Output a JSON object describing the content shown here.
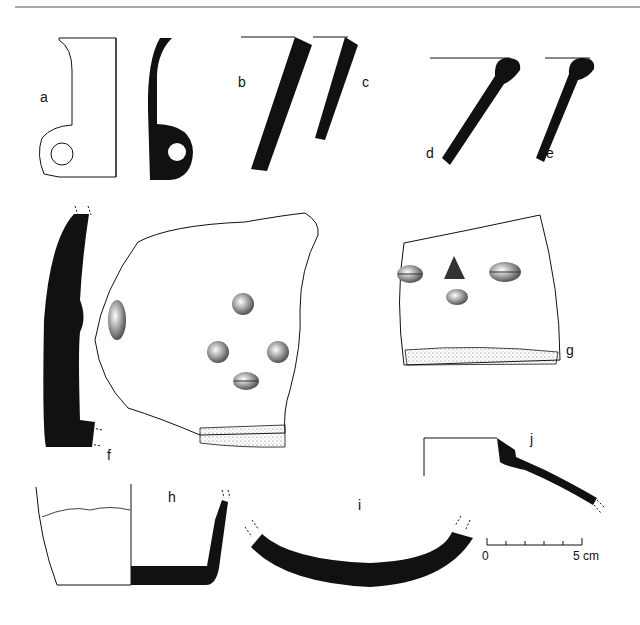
{
  "figure": {
    "labels": {
      "a": "a",
      "b": "b",
      "c": "c",
      "d": "d",
      "e": "e",
      "f": "f",
      "g": "g",
      "h": "h",
      "i": "i",
      "j": "j"
    },
    "scale_bar": {
      "start_label": "0",
      "end_label": "5 cm",
      "divisions": 5
    },
    "colors": {
      "ink": "#111111",
      "background": "#ffffff"
    }
  }
}
